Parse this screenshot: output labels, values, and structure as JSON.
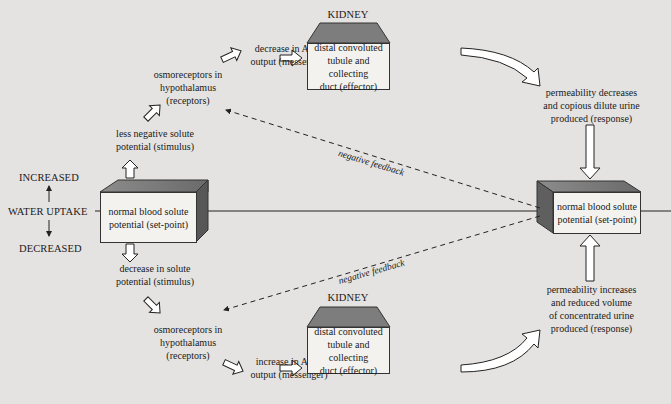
{
  "diagram": {
    "type": "negative-feedback-loop",
    "colors": {
      "background": "#e4e3e1",
      "box_face": "#f3f2ef",
      "box_top": "#7a7a7a",
      "box_side": "#555555",
      "line": "#222222"
    }
  },
  "left": {
    "increased": "INCREASED",
    "water_uptake": "WATER UPTAKE",
    "decreased": "DECREASED",
    "setpoint_line1": "normal blood solute",
    "setpoint_line2": "potential (set-point)"
  },
  "right": {
    "setpoint_line1": "normal blood solute",
    "setpoint_line2": "potential (set-point)"
  },
  "top_branch": {
    "stimulus_line1": "less negative solute",
    "stimulus_line2": "potential (stimulus)",
    "receptor_line1": "osmoreceptors in",
    "receptor_line2": "hypothalamus",
    "receptor_line3": "(receptors)",
    "messenger_line1": "decrease in ADH",
    "messenger_line2": "output (messenger)",
    "organ": "KIDNEY",
    "effector_line1": "distal convoluted",
    "effector_line2": "tubule and collecting",
    "effector_line3": "duct (effector)",
    "response_line1": "permeability decreases",
    "response_line2": "and copious dilute urine",
    "response_line3": "produced (response)",
    "feedback": "negative feedback"
  },
  "bottom_branch": {
    "stimulus_line1": "decrease in solute",
    "stimulus_line2": "potential (stimulus)",
    "receptor_line1": "osmoreceptors in",
    "receptor_line2": "hypothalamus",
    "receptor_line3": "(receptors)",
    "messenger_line1": "increase in ADH",
    "messenger_line2": "output (messenger)",
    "organ": "KIDNEY",
    "effector_line1": "distal convoluted",
    "effector_line2": "tubule and collecting",
    "effector_line3": "duct (effector)",
    "response_line1": "permeability increases",
    "response_line2": "and reduced volume",
    "response_line3": "of concentrated urine",
    "response_line4": "produced (response)",
    "feedback": "negative feedback"
  }
}
